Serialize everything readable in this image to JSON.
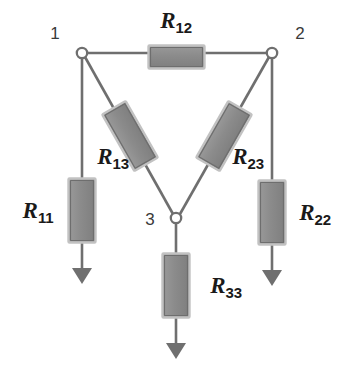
{
  "diagram": {
    "background_color": "#ffffff",
    "wire_color": "#6f6f6f",
    "resistor_fill": "#8a8a8a",
    "resistor_edge": "#b9b9b9",
    "resistor_stroke": "#6b6b6b",
    "arrow_color": "#6f6f6f",
    "node_fill": "#ffffff",
    "node_stroke": "#6f6f6f",
    "label_color": "#1a1a1a"
  },
  "nodes": [
    {
      "id": "1",
      "label": "1",
      "cx": 82,
      "cy": 53,
      "label_x": 55,
      "label_y": 33
    },
    {
      "id": "2",
      "label": "2",
      "cx": 272,
      "cy": 53,
      "label_x": 300,
      "label_y": 33
    },
    {
      "id": "3",
      "label": "3",
      "cx": 176,
      "cy": 218,
      "label_x": 150,
      "label_y": 219
    }
  ],
  "resistors": [
    {
      "id": "R12",
      "base": "R",
      "subscript": "12",
      "orientation": "horizontal",
      "between": [
        "1",
        "2"
      ],
      "label_x": 176,
      "label_y": 22
    },
    {
      "id": "R13",
      "base": "R",
      "subscript": "13",
      "orientation": "diagonal",
      "between": [
        "1",
        "3"
      ],
      "label_x": 113,
      "label_y": 158
    },
    {
      "id": "R23",
      "base": "R",
      "subscript": "23",
      "orientation": "diagonal",
      "between": [
        "2",
        "3"
      ],
      "label_x": 248,
      "label_y": 158
    },
    {
      "id": "R11",
      "base": "R",
      "subscript": "11",
      "orientation": "vertical",
      "between": [
        "1",
        "ground"
      ],
      "label_x": 38,
      "label_y": 212
    },
    {
      "id": "R22",
      "base": "R",
      "subscript": "22",
      "orientation": "vertical",
      "between": [
        "2",
        "ground"
      ],
      "label_x": 315,
      "label_y": 214
    },
    {
      "id": "R33",
      "base": "R",
      "subscript": "33",
      "orientation": "vertical",
      "between": [
        "3",
        "ground"
      ],
      "label_x": 226,
      "label_y": 287
    }
  ],
  "arrows": [
    {
      "id": "arrow-R11",
      "x": 82,
      "tip_y": 284
    },
    {
      "id": "arrow-R22",
      "x": 272,
      "tip_y": 286
    },
    {
      "id": "arrow-R33",
      "x": 176,
      "tip_y": 359
    }
  ]
}
